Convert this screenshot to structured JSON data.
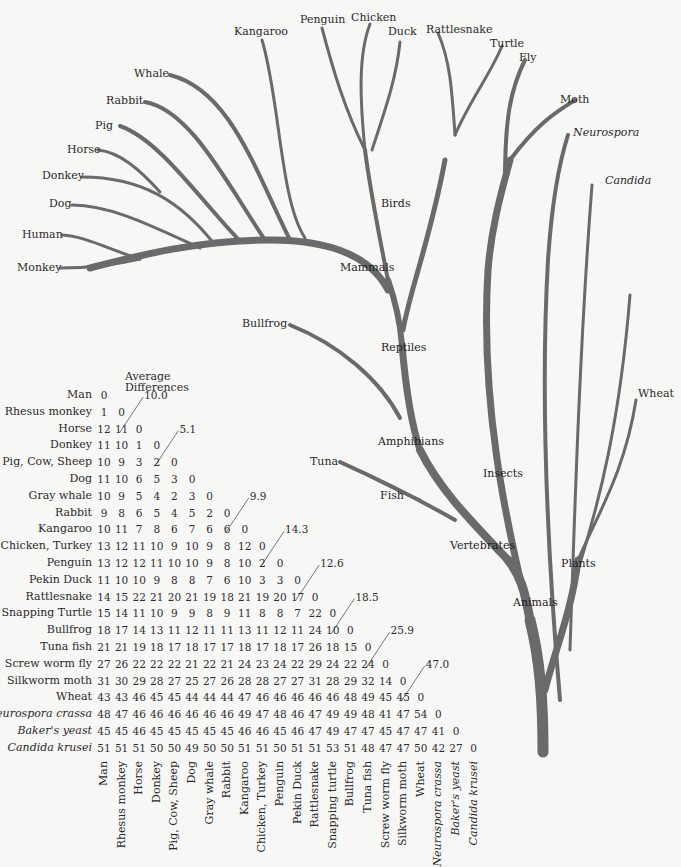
{
  "tree": {
    "leaves": [
      {
        "id": "monkey",
        "label": "Monkey"
      },
      {
        "id": "human",
        "label": "Human"
      },
      {
        "id": "dog",
        "label": "Dog"
      },
      {
        "id": "donkey",
        "label": "Donkey"
      },
      {
        "id": "horse",
        "label": "Horse"
      },
      {
        "id": "pig",
        "label": "Pig"
      },
      {
        "id": "rabbit",
        "label": "Rabbit"
      },
      {
        "id": "whale",
        "label": "Whale"
      },
      {
        "id": "kangaroo",
        "label": "Kangaroo"
      },
      {
        "id": "penguin",
        "label": "Penguin"
      },
      {
        "id": "chicken",
        "label": "Chicken"
      },
      {
        "id": "duck",
        "label": "Duck"
      },
      {
        "id": "rattlesnake",
        "label": "Rattlesnake"
      },
      {
        "id": "turtle",
        "label": "Turtle"
      },
      {
        "id": "fly",
        "label": "Fly"
      },
      {
        "id": "moth",
        "label": "Moth"
      },
      {
        "id": "neurospora",
        "label": "Neurospora"
      },
      {
        "id": "candida",
        "label": "Candida"
      },
      {
        "id": "wheat",
        "label": "Wheat"
      },
      {
        "id": "bullfrog",
        "label": "Bullfrog"
      },
      {
        "id": "tuna",
        "label": "Tuna"
      }
    ],
    "groups": {
      "mammals": "Mammals",
      "birds": "Birds",
      "reptiles": "Reptiles",
      "amphibians": "Amphibians",
      "fish": "Fish",
      "vertebrates": "Vertebrates",
      "insects": "Insects",
      "plants": "Plants",
      "animals": "Animals"
    }
  },
  "matrix": {
    "header_line1": "Average",
    "header_line2": "Differences",
    "species": [
      {
        "label": "Man",
        "col": "Man",
        "italic": false
      },
      {
        "label": "Rhesus monkey",
        "col": "Rhesus monkey",
        "italic": false
      },
      {
        "label": "Horse",
        "col": "Horse",
        "italic": false
      },
      {
        "label": "Donkey",
        "col": "Donkey",
        "italic": false
      },
      {
        "label": "Pig, Cow, Sheep",
        "col": "Pig, Cow, Sheep",
        "italic": false
      },
      {
        "label": "Dog",
        "col": "Dog",
        "italic": false
      },
      {
        "label": "Gray whale",
        "col": "Gray whale",
        "italic": false
      },
      {
        "label": "Rabbit",
        "col": "Rabbit",
        "italic": false
      },
      {
        "label": "Kangaroo",
        "col": "Kangaroo",
        "italic": false
      },
      {
        "label": "Chicken, Turkey",
        "col": "Chicken, Turkey",
        "italic": false
      },
      {
        "label": "Penguin",
        "col": "Penguin",
        "italic": false
      },
      {
        "label": "Pekin Duck",
        "col": "Pekin Duck",
        "italic": false
      },
      {
        "label": "Rattlesnake",
        "col": "Rattlesnake",
        "italic": false
      },
      {
        "label": "Snapping Turtle",
        "col": "Snapping turtle",
        "italic": false
      },
      {
        "label": "Bullfrog",
        "col": "Bullfrog",
        "italic": false
      },
      {
        "label": "Tuna fish",
        "col": "Tuna fish",
        "italic": false
      },
      {
        "label": "Screw worm fly",
        "col": "Screw worm fly",
        "italic": false
      },
      {
        "label": "Silkworm moth",
        "col": "Silkworm moth",
        "italic": false
      },
      {
        "label": "Wheat",
        "col": "Wheat",
        "italic": false
      },
      {
        "label": "Neurospora crassa",
        "col": "Neurospora crassa",
        "italic": true
      },
      {
        "label": "Baker's yeast",
        "col": "Baker's yeast",
        "italic": true
      },
      {
        "label": "Candida krusei",
        "col": "Candida krusei",
        "italic": true
      }
    ],
    "rows": [
      [
        0
      ],
      [
        1,
        0
      ],
      [
        12,
        11,
        0
      ],
      [
        11,
        10,
        1,
        0
      ],
      [
        10,
        9,
        3,
        2,
        0
      ],
      [
        11,
        10,
        6,
        5,
        3,
        0
      ],
      [
        10,
        9,
        5,
        4,
        2,
        3,
        0
      ],
      [
        9,
        8,
        6,
        5,
        4,
        5,
        2,
        0
      ],
      [
        10,
        11,
        7,
        8,
        6,
        7,
        6,
        6,
        0
      ],
      [
        13,
        12,
        11,
        10,
        9,
        10,
        9,
        8,
        12,
        0
      ],
      [
        13,
        12,
        12,
        11,
        10,
        10,
        9,
        8,
        10,
        2,
        0
      ],
      [
        11,
        10,
        10,
        9,
        8,
        8,
        7,
        6,
        10,
        3,
        3,
        0
      ],
      [
        14,
        15,
        22,
        21,
        20,
        21,
        19,
        18,
        21,
        19,
        20,
        17,
        0
      ],
      [
        15,
        14,
        11,
        10,
        9,
        9,
        8,
        9,
        11,
        8,
        8,
        7,
        22,
        0
      ],
      [
        18,
        17,
        14,
        13,
        11,
        12,
        11,
        11,
        13,
        11,
        12,
        11,
        24,
        10,
        0
      ],
      [
        21,
        21,
        19,
        18,
        17,
        18,
        17,
        17,
        18,
        17,
        18,
        17,
        26,
        18,
        15,
        0
      ],
      [
        27,
        26,
        22,
        22,
        22,
        21,
        22,
        21,
        24,
        23,
        24,
        22,
        29,
        24,
        22,
        24,
        0
      ],
      [
        31,
        30,
        29,
        28,
        27,
        25,
        27,
        26,
        28,
        28,
        27,
        27,
        31,
        28,
        29,
        32,
        14,
        0
      ],
      [
        43,
        43,
        46,
        45,
        45,
        44,
        44,
        44,
        47,
        46,
        46,
        46,
        46,
        46,
        48,
        49,
        45,
        45,
        0
      ],
      [
        48,
        47,
        46,
        46,
        46,
        46,
        46,
        46,
        49,
        47,
        48,
        46,
        47,
        49,
        49,
        48,
        41,
        47,
        54,
        0
      ],
      [
        45,
        45,
        46,
        45,
        45,
        45,
        45,
        45,
        46,
        46,
        45,
        46,
        47,
        49,
        47,
        47,
        45,
        47,
        47,
        41,
        0
      ],
      [
        51,
        51,
        51,
        50,
        50,
        49,
        50,
        50,
        51,
        51,
        50,
        51,
        51,
        53,
        51,
        48,
        47,
        47,
        50,
        42,
        27,
        0
      ]
    ],
    "averages": [
      {
        "value": "10.0",
        "row": 1,
        "col": 2
      },
      {
        "value": "5.1",
        "row": 3,
        "col": 4
      },
      {
        "value": "9.9",
        "row": 7,
        "col": 8
      },
      {
        "value": "14.3",
        "row": 9,
        "col": 10
      },
      {
        "value": "12.6",
        "row": 11,
        "col": 12
      },
      {
        "value": "18.5",
        "row": 13,
        "col": 14
      },
      {
        "value": "25.9",
        "row": 15,
        "col": 16
      },
      {
        "value": "47.0",
        "row": 17,
        "col": 18
      }
    ]
  }
}
